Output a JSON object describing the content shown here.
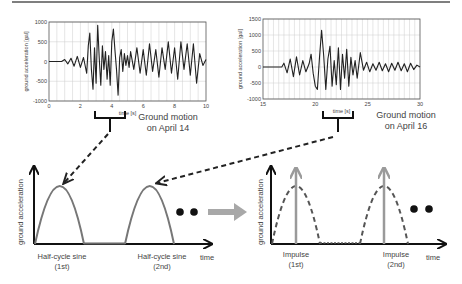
{
  "colors": {
    "trace": "#222222",
    "grid": "#cccccc",
    "sine": "#777777",
    "dashed_arrow": "#222222",
    "impulse": "#9a9a9a",
    "transform_arrow": "#a8a8a8",
    "axis": "#111111",
    "text": "#444444"
  },
  "top_rule": true,
  "chart_data": [
    {
      "type": "line",
      "title": "",
      "caption": [
        "Ground motion",
        "on April 14"
      ],
      "xlabel": "time [s]",
      "ylabel": "ground acceleration [gal]",
      "xlim": [
        0,
        10
      ],
      "ylim": [
        -1000,
        1000
      ],
      "xticks": [
        "0",
        "2",
        "4",
        "6",
        "8",
        "10"
      ],
      "yticks": [
        "1000",
        "500",
        "0",
        "-500",
        "-1000"
      ],
      "grid": true,
      "x": [
        0,
        0.8,
        1.0,
        1.2,
        1.4,
        1.6,
        1.8,
        2.0,
        2.2,
        2.4,
        2.5,
        2.6,
        2.7,
        2.8,
        2.9,
        3.0,
        3.1,
        3.2,
        3.3,
        3.4,
        3.5,
        3.6,
        3.7,
        3.8,
        3.9,
        4.0,
        4.1,
        4.2,
        4.3,
        4.4,
        4.5,
        4.6,
        4.7,
        4.8,
        4.9,
        5.0,
        5.1,
        5.2,
        5.4,
        5.6,
        5.8,
        6.0,
        6.2,
        6.4,
        6.6,
        6.8,
        7.0,
        7.2,
        7.4,
        7.6,
        7.8,
        8.0,
        8.2,
        8.4,
        8.6,
        8.8,
        9.0,
        9.2,
        9.4,
        9.6,
        9.8,
        10.0
      ],
      "values": [
        0,
        0,
        50,
        -60,
        80,
        -120,
        130,
        -150,
        100,
        -300,
        400,
        720,
        -200,
        -700,
        350,
        -550,
        920,
        100,
        -600,
        400,
        -200,
        250,
        -450,
        150,
        -600,
        500,
        820,
        300,
        -200,
        -850,
        100,
        300,
        -250,
        200,
        -100,
        150,
        -150,
        250,
        -200,
        350,
        -300,
        300,
        -350,
        450,
        -250,
        300,
        -400,
        350,
        -200,
        500,
        -300,
        350,
        -450,
        500,
        -200,
        450,
        -350,
        450,
        -550,
        200,
        -100,
        50
      ]
    },
    {
      "type": "line",
      "title": "",
      "caption": [
        "Ground motion",
        "on April 16"
      ],
      "xlabel": "time [s]",
      "ylabel": "ground acceleration [gal]",
      "xlim": [
        15,
        30
      ],
      "ylim": [
        -1000,
        1500
      ],
      "xticks": [
        "15",
        "20",
        "25",
        "30"
      ],
      "yticks": [
        "1500",
        "1000",
        "500",
        "0",
        "-500",
        "-1000"
      ],
      "grid": true,
      "x": [
        15,
        16.8,
        17.0,
        17.3,
        17.6,
        17.9,
        18.2,
        18.5,
        18.8,
        19.1,
        19.4,
        19.6,
        19.8,
        20.0,
        20.2,
        20.4,
        20.6,
        20.8,
        21.0,
        21.2,
        21.4,
        21.6,
        21.8,
        22.0,
        22.2,
        22.4,
        22.6,
        22.8,
        23.0,
        23.2,
        23.4,
        23.6,
        23.8,
        24.0,
        24.3,
        24.6,
        24.9,
        25.2,
        25.5,
        25.8,
        26.1,
        26.4,
        26.7,
        27.0,
        27.3,
        27.6,
        27.9,
        28.2,
        28.5,
        28.8,
        29.1,
        29.4,
        29.7,
        30.0
      ],
      "values": [
        0,
        0,
        120,
        -180,
        250,
        -300,
        320,
        -250,
        200,
        -150,
        100,
        400,
        -200,
        -600,
        -700,
        300,
        1150,
        350,
        -700,
        250,
        650,
        -600,
        200,
        -550,
        600,
        -700,
        400,
        -350,
        550,
        -600,
        300,
        -250,
        200,
        -350,
        450,
        -100,
        150,
        -150,
        100,
        -100,
        150,
        -120,
        100,
        -150,
        120,
        -100,
        150,
        -120,
        100,
        -150,
        120,
        -80,
        60,
        0
      ]
    }
  ],
  "diagram": {
    "left_panel": {
      "ylabel": "ground acceleration",
      "xlabel": "time",
      "shape": "half-cycle sine",
      "labels": [
        {
          "line1": "Half-cycle sine",
          "line2": "(1st)"
        },
        {
          "line1": "Half-cycle sine",
          "line2": "(2nd)"
        }
      ],
      "ellipsis": "● ●"
    },
    "right_panel": {
      "ylabel": "ground acceleration",
      "xlabel": "time",
      "shape": "impulse",
      "labels": [
        {
          "line1": "Impulse",
          "line2": "(1st)"
        },
        {
          "line1": "Impulse",
          "line2": "(2nd)"
        }
      ],
      "ellipsis": "● ●"
    },
    "transform_arrow": "right-arrow"
  }
}
